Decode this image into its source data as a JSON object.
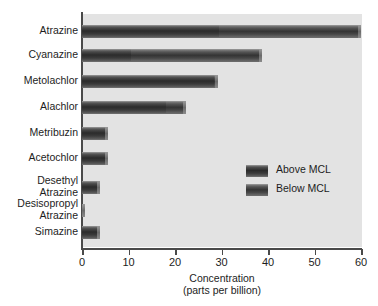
{
  "chart_data": {
    "type": "bar",
    "orientation": "horizontal",
    "stacked": true,
    "title": "",
    "xlabel_line1": "Concentration",
    "xlabel_line2": "(parts per billion)",
    "ylabel": "",
    "xlim": [
      0,
      60
    ],
    "xticks": [
      0,
      10,
      20,
      30,
      40,
      50,
      60
    ],
    "xtick_labels": [
      "0",
      "10",
      "20",
      "30",
      "40",
      "50",
      "60"
    ],
    "grid": false,
    "legend_position": "center-right",
    "categories": [
      "Atrazine",
      "Cyanazine",
      "Metolachlor",
      "Alachlor",
      "Metribuzin",
      "Acetochlor",
      "Desethyl\nAtrazine",
      "Desisopropyl\nAtrazine",
      "Simazine"
    ],
    "series": [
      {
        "name": "Above MCL",
        "color": "#333333",
        "values": [
          29.5,
          10.5,
          28.3,
          18.0,
          5.6,
          5.6,
          3.9,
          0.7,
          3.9
        ]
      },
      {
        "name": "Below MCL",
        "color": "#3d3d3d",
        "values": [
          30.5,
          28.2,
          1.0,
          4.4,
          0.0,
          0.0,
          0.0,
          0.0,
          0.0
        ]
      }
    ],
    "totals": [
      60.0,
      38.7,
      29.3,
      22.4,
      5.6,
      5.6,
      3.9,
      0.7,
      3.9
    ],
    "plot_background": "#e3e3e3",
    "axis_color": "#4a4a4a"
  },
  "legend": {
    "items": [
      {
        "label": "Above MCL",
        "swatch": "above-mcl"
      },
      {
        "label": "Below MCL",
        "swatch": "below-mcl"
      }
    ]
  }
}
